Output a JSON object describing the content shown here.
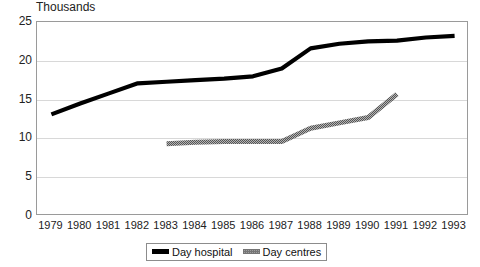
{
  "chart_data": {
    "type": "line",
    "title": "Thousands",
    "xlabel": "",
    "ylabel": "",
    "ylim": [
      0,
      25
    ],
    "yticks": [
      0,
      5,
      10,
      15,
      20,
      25
    ],
    "grid": true,
    "legend_position": "bottom",
    "categories": [
      "1979",
      "1980",
      "1981",
      "1982",
      "1983",
      "1984",
      "1985",
      "1986",
      "1987",
      "1988",
      "1989",
      "1990",
      "1991",
      "1992",
      "1993"
    ],
    "series": [
      {
        "name": "Day hospital",
        "color": "#000000",
        "style": "solid-thick",
        "values": [
          13.1,
          14.5,
          15.8,
          17.1,
          17.3,
          17.5,
          17.7,
          18.0,
          19.0,
          21.6,
          22.2,
          22.5,
          22.6,
          23.0,
          23.2
        ]
      },
      {
        "name": "Day centres",
        "color": "#8f8f8f",
        "style": "dotted-thick",
        "values": [
          null,
          null,
          null,
          null,
          9.3,
          9.5,
          9.6,
          9.6,
          9.6,
          11.3,
          12.0,
          12.7,
          15.7,
          null,
          null
        ]
      }
    ]
  },
  "legend": {
    "items": [
      {
        "label": "Day hospital",
        "swatch": "thick-black-line-swatch"
      },
      {
        "label": "Day centres",
        "swatch": "dotted-gray-line-swatch"
      }
    ]
  }
}
